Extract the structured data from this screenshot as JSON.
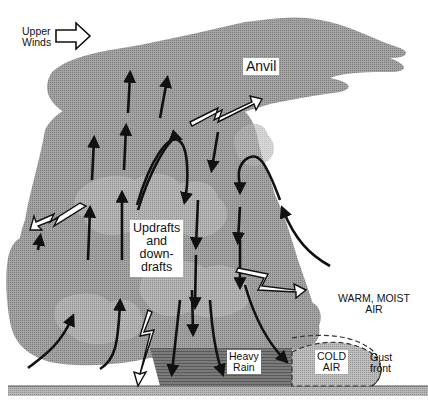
{
  "diagram": {
    "type": "thunderstorm-cross-section",
    "labels": {
      "upper_winds_line1": "Upper",
      "upper_winds_line2": "Winds",
      "anvil": "Anvil",
      "updrafts_line1": "Updrafts",
      "updrafts_line2": "and",
      "updrafts_line3": "down-",
      "updrafts_line4": "drafts",
      "warm_moist_line1": "WARM, MOIST",
      "warm_moist_line2": "AIR",
      "heavy_rain_line1": "Heavy",
      "heavy_rain_line2": "Rain",
      "cold_air_line1": "COLD",
      "cold_air_line2": "AIR",
      "gust_front_line1": "Gust",
      "gust_front_line2": "front"
    },
    "elements": [
      "cumulonimbus-cloud",
      "anvil-top",
      "updraft-arrows",
      "downdraft-arrows",
      "lightning-arrows",
      "rain-shaft",
      "cold-air-outflow",
      "gust-front-boundary",
      "ground"
    ],
    "colors": {
      "cloud": "#9a9a9a",
      "cloud_dark": "#8a8a8a",
      "cloud_light": "#b0b0b0",
      "rain": "#6e6e6e",
      "cold_air": "#b4b4b4",
      "ground": "#a8a8a8",
      "arrow": "#111111",
      "background": "#ffffff"
    }
  }
}
